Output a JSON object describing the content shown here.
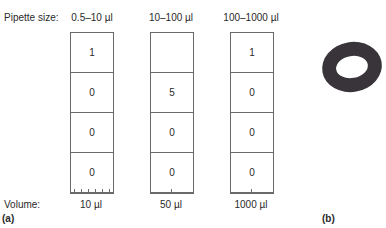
{
  "figure": {
    "row_labels": {
      "pipette_size": "Pipette size:",
      "volume": "Volume:"
    },
    "columns": [
      {
        "size": "0.5–10 µl",
        "digits": [
          "1",
          "0",
          "0",
          "0"
        ],
        "volume": "10 µl",
        "ticks": 6
      },
      {
        "size": "10–100 µl",
        "digits": [
          "",
          "5",
          "0",
          "0"
        ],
        "volume": "50 µl",
        "ticks": 1
      },
      {
        "size": "100–1000 µl",
        "digits": [
          "1",
          "0",
          "0",
          "0"
        ],
        "volume": "1000 µl",
        "ticks": 1
      }
    ],
    "panel_labels": {
      "a": "(a)",
      "b": "(b)"
    },
    "colors": {
      "line": "#6a6a6a",
      "text": "#2a2a2a",
      "ring": "#38343a"
    }
  }
}
